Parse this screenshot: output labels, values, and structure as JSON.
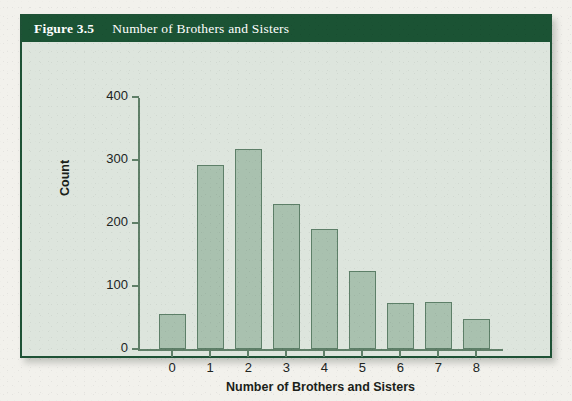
{
  "figure": {
    "number": "Figure 3.5",
    "caption": "Number of Brothers and Sisters",
    "header_color": "#1b5334",
    "panel_color": "#dde5dd",
    "border_color": "#1e5236"
  },
  "chart_data": {
    "type": "bar",
    "title": "Number of Brothers and Sisters",
    "xlabel": "Number of Brothers and Sisters",
    "ylabel": "Count",
    "categories": [
      "0",
      "1",
      "2",
      "3",
      "4",
      "5",
      "6",
      "7",
      "8"
    ],
    "values": [
      55,
      292,
      318,
      230,
      190,
      124,
      73,
      74,
      48
    ],
    "ylim": [
      0,
      400
    ],
    "yticks": [
      0,
      100,
      200,
      300,
      400
    ],
    "ytick_labels": [
      "0",
      "100",
      "200",
      "300",
      "400"
    ],
    "grid": false,
    "legend": null,
    "bar_fill_color": "#a9c1af",
    "bar_edge_color": "#5d7f68",
    "axis_color": "#5f7f68"
  }
}
